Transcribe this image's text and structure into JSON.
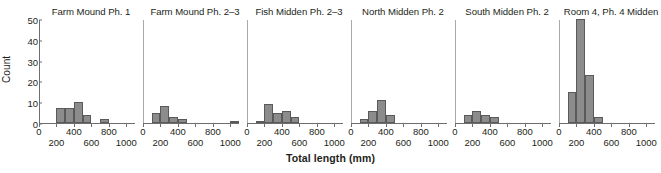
{
  "chart_data": {
    "type": "bar",
    "title": "",
    "xlabel": "Total length (mm)",
    "ylabel": "Count",
    "ylim": [
      0,
      50
    ],
    "xlim": [
      0,
      1100
    ],
    "yticks": [
      0,
      10,
      20,
      30,
      40,
      50
    ],
    "xticks_upper": [
      0,
      400,
      800
    ],
    "xticks_lower": [
      200,
      600,
      1000
    ],
    "grid": false,
    "legend": "none",
    "bin_width": 100,
    "bar_color": "#8c8c8c",
    "bar_edge_color": "#5a5a5a",
    "axis_color": "#6d6e71",
    "panels": [
      {
        "title": "Farm Mound Ph. 1",
        "bin_starts": [
          200,
          300,
          400,
          500,
          700
        ],
        "values": [
          7,
          7,
          10,
          4,
          2
        ]
      },
      {
        "title": "Farm Mound Ph. 2–3",
        "bin_starts": [
          100,
          200,
          300,
          400,
          1000
        ],
        "values": [
          5,
          8,
          3,
          2,
          1
        ]
      },
      {
        "title": "Fish Midden Ph. 2–3",
        "bin_starts": [
          100,
          200,
          300,
          400,
          500
        ],
        "values": [
          1,
          9,
          5,
          6,
          3
        ]
      },
      {
        "title": "North Midden Ph. 2",
        "bin_starts": [
          100,
          200,
          300,
          400
        ],
        "values": [
          2,
          6,
          11,
          4
        ]
      },
      {
        "title": "South Midden Ph. 2",
        "bin_starts": [
          100,
          200,
          300,
          400
        ],
        "values": [
          4,
          6,
          4,
          3
        ]
      },
      {
        "title": "Room 4, Ph. 4 Midden",
        "bin_starts": [
          100,
          200,
          300,
          400
        ],
        "values": [
          15,
          50,
          23,
          3
        ]
      }
    ]
  }
}
